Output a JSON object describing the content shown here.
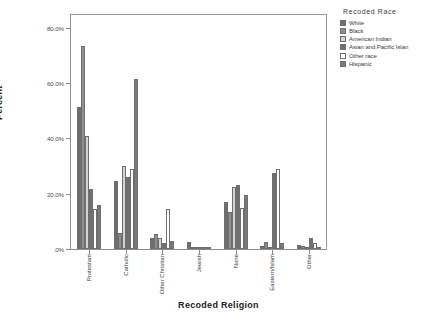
{
  "chart_data": {
    "type": "bar",
    "title": "",
    "xlabel": "Recoded Religion",
    "ylabel": "Percent",
    "ylim": [
      0,
      85
    ],
    "grid": false,
    "legend_position": "right",
    "legend_title": "Recoded Race",
    "ytick_labels": [
      ".0%",
      "20.0%",
      "40.0%",
      "60.0%",
      "80.0%"
    ],
    "ytick_values": [
      0,
      20,
      40,
      60,
      80
    ],
    "categories": [
      "Protestant",
      "Catholic",
      "Other Christian",
      "Jewish",
      "None",
      "Eastern/Islam",
      "Other"
    ],
    "series": [
      {
        "name": "White",
        "color": "#6e6e6e",
        "values": [
          51.5,
          24.5,
          4.0,
          2.6,
          17.0,
          1.0,
          1.3
        ]
      },
      {
        "name": "Black",
        "color": "#8f8f8f",
        "values": [
          73.5,
          5.8,
          5.5,
          0.2,
          13.5,
          2.5,
          1.0
        ]
      },
      {
        "name": "American Indian",
        "color": "#d3d3d3",
        "values": [
          41.0,
          30.0,
          4.0,
          0.1,
          22.5,
          0.3,
          0.2
        ]
      },
      {
        "name": "Asian and Pacific Islan",
        "color": "#707070",
        "values": [
          21.8,
          26.2,
          2.0,
          0.1,
          23.2,
          27.5,
          4.0
        ]
      },
      {
        "name": "Other race",
        "color": "#fefefe",
        "values": [
          14.5,
          29.0,
          14.5,
          0.1,
          14.7,
          29.0,
          2.2
        ]
      },
      {
        "name": "Hispanic",
        "color": "#7a7a7a",
        "values": [
          16.0,
          61.5,
          3.0,
          0.1,
          19.5,
          2.0,
          0.2
        ]
      }
    ]
  }
}
